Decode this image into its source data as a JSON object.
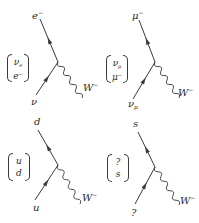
{
  "figure": {
    "colors": {
      "line": "#3a3a3a",
      "text": "#2a2a2a",
      "background": "#ffffff"
    },
    "panels": [
      {
        "id": "electron",
        "top_particle": {
          "base": "e",
          "sup": "−",
          "sub": ""
        },
        "bottom_particle": {
          "base": "ν",
          "sup": "",
          "sub": ""
        },
        "boson": {
          "base": "W",
          "sup": "−"
        },
        "doublet": {
          "top_base": "ν",
          "top_sub": "e",
          "top_sup": "",
          "bot_base": "e",
          "bot_sub": "",
          "bot_sup": "−"
        },
        "geometry": {
          "top": [
            40,
            19
          ],
          "vertex": [
            58,
            62
          ],
          "bottom": [
            36,
            95
          ],
          "boson_end": [
            82,
            98
          ],
          "top_label": [
            32,
            8
          ],
          "bottom_label": [
            31,
            97
          ],
          "boson_label": [
            83,
            80
          ],
          "doublet": [
            7,
            54
          ]
        }
      },
      {
        "id": "muon",
        "top_particle": {
          "base": "μ",
          "sup": "−",
          "sub": ""
        },
        "bottom_particle": {
          "base": "ν",
          "sup": "",
          "sub": "μ"
        },
        "boson": {
          "base": "W",
          "sup": "−"
        },
        "doublet": {
          "top_base": "ν",
          "top_sub": "μ",
          "top_sup": "",
          "bot_base": "μ",
          "bot_sub": "",
          "bot_sup": "−"
        },
        "geometry": {
          "top": [
            139,
            20
          ],
          "vertex": [
            155,
            62
          ],
          "bottom": [
            133,
            99
          ],
          "boson_end": [
            179,
            98
          ],
          "top_label": [
            132,
            8
          ],
          "bottom_label": [
            128,
            99
          ],
          "boson_label": [
            178,
            85
          ],
          "doublet": [
            106,
            55
          ]
        }
      },
      {
        "id": "down",
        "top_particle": {
          "base": "d",
          "sup": "",
          "sub": ""
        },
        "bottom_particle": {
          "base": "u",
          "sup": "",
          "sub": ""
        },
        "boson": {
          "base": "W",
          "sup": "−"
        },
        "doublet": {
          "top_base": "u",
          "top_sub": "",
          "top_sup": "",
          "bot_base": "d",
          "bot_sub": "",
          "bot_sup": ""
        },
        "geometry": {
          "top": [
            38,
            130
          ],
          "vertex": [
            58,
            165
          ],
          "bottom": [
            35,
            200
          ],
          "boson_end": [
            80,
            204
          ],
          "top_label": [
            34,
            117
          ],
          "bottom_label": [
            33,
            203
          ],
          "boson_label": [
            82,
            190
          ],
          "doublet": [
            8,
            153
          ]
        }
      },
      {
        "id": "strange",
        "top_particle": {
          "base": "s",
          "sup": "",
          "sub": ""
        },
        "bottom_particle": {
          "base": "?",
          "sup": "",
          "sub": ""
        },
        "boson": {
          "base": "W",
          "sup": "−"
        },
        "doublet": {
          "top_base": "?",
          "top_sub": "",
          "top_sup": "",
          "bot_base": "s",
          "bot_sub": "",
          "bot_sup": ""
        },
        "geometry": {
          "top": [
            138,
            132
          ],
          "vertex": [
            155,
            167
          ],
          "bottom": [
            135,
            204
          ],
          "boson_end": [
            179,
            205
          ],
          "top_label": [
            133,
            119
          ],
          "bottom_label": [
            131,
            208
          ],
          "boson_label": [
            180,
            193
          ],
          "doublet": [
            107,
            154
          ]
        }
      }
    ]
  }
}
